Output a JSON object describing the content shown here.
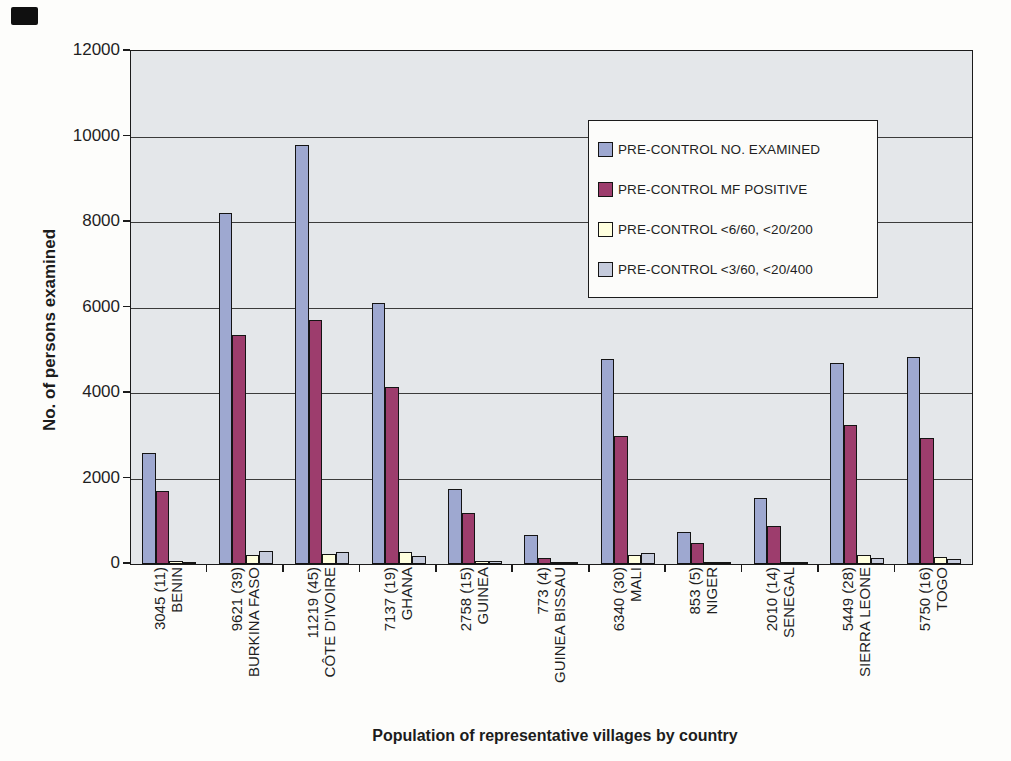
{
  "chart_data": {
    "type": "bar",
    "title": "",
    "xlabel": "Population of representative villages by country",
    "ylabel": "No. of persons examined",
    "ylim": [
      0,
      12000
    ],
    "ytick_interval": 2000,
    "ytick_labels": [
      "12000",
      "10000",
      "8000",
      "6000",
      "4000",
      "2000",
      "0"
    ],
    "grid": true,
    "plot_background": "#e4e7ea",
    "legend_position": "inside-top-right",
    "categories": [
      {
        "value_label": "3045 (11)",
        "country": "BENIN"
      },
      {
        "value_label": "9621 (39)",
        "country": "BURKINA FASO"
      },
      {
        "value_label": "11219 (45)",
        "country": "CÔTE D'IVOIRE"
      },
      {
        "value_label": "7137 (19)",
        "country": "GHANA"
      },
      {
        "value_label": "2758 (15)",
        "country": "GUINEA"
      },
      {
        "value_label": "773 (4)",
        "country": "GUINEA BISSAU"
      },
      {
        "value_label": "6340 (30)",
        "country": "MALI"
      },
      {
        "value_label": "853 (5)",
        "country": "NIGER"
      },
      {
        "value_label": "2010 (14)",
        "country": "SENEGAL"
      },
      {
        "value_label": "5449 (28)",
        "country": "SIERRA LEONE"
      },
      {
        "value_label": "5750 (16)",
        "country": "TOGO"
      }
    ],
    "series": [
      {
        "name": "PRE-CONTROL NO. EXAMINED",
        "color": "#9ea8d0",
        "values": [
          2600,
          8200,
          9800,
          6100,
          1750,
          680,
          4800,
          750,
          1550,
          4700,
          4850
        ]
      },
      {
        "name": "PRE-CONTROL MF POSITIVE",
        "color": "#9d3d6d",
        "values": [
          1700,
          5350,
          5700,
          4150,
          1200,
          150,
          3000,
          480,
          900,
          3250,
          2950
        ]
      },
      {
        "name": "PRE-CONTROL <6/60, <20/200",
        "color": "#ffffde",
        "values": [
          60,
          200,
          230,
          280,
          80,
          15,
          200,
          30,
          30,
          220,
          160
        ]
      },
      {
        "name": "PRE-CONTROL <3/60, <20/400",
        "color": "#c5cbdc",
        "values": [
          30,
          300,
          270,
          180,
          60,
          10,
          250,
          20,
          20,
          140,
          120
        ]
      }
    ]
  }
}
